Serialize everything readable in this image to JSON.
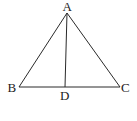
{
  "diagram": {
    "type": "triangle-with-cevian",
    "points": {
      "A": {
        "label": "A",
        "x": 67,
        "y": 13
      },
      "B": {
        "label": "B",
        "x": 19,
        "y": 87
      },
      "C": {
        "label": "C",
        "x": 120,
        "y": 87
      },
      "D": {
        "label": "D",
        "x": 65,
        "y": 87
      }
    },
    "segments": [
      "AB",
      "AC",
      "BC",
      "AD"
    ],
    "stroke_color": "#2a2a2a",
    "label_color": "#222222"
  }
}
